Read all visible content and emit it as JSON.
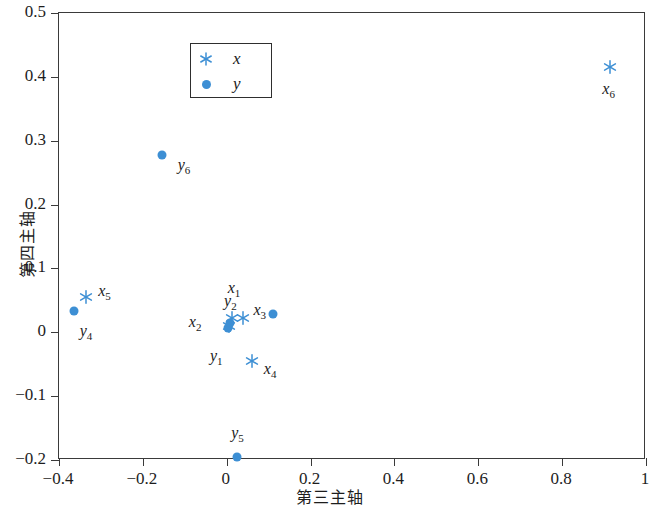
{
  "chart_data": {
    "type": "scatter",
    "title": "",
    "xlabel": "第三主轴",
    "ylabel": "第四主轴",
    "xlim": [
      -0.4,
      1.0
    ],
    "ylim": [
      -0.2,
      0.5
    ],
    "xticks": [
      -0.4,
      -0.2,
      0,
      0.2,
      0.4,
      0.6,
      0.8,
      1
    ],
    "xticklabels": [
      "-0.4",
      "-0.2",
      "0",
      "0.2",
      "0.4",
      "0.6",
      "0.8",
      "1"
    ],
    "yticks": [
      -0.2,
      -0.1,
      0,
      0.1,
      0.2,
      0.3,
      0.4,
      0.5
    ],
    "yticklabels": [
      "-0.2",
      "-0.1",
      "0",
      "0.1",
      "0.2",
      "0.3",
      "0.4",
      "0.5"
    ],
    "grid": false,
    "legend_position": "upper-left-inside",
    "legend": [
      {
        "name": "x",
        "marker": "asterisk",
        "color": "#3d8fd4"
      },
      {
        "name": "y",
        "marker": "circle",
        "color": "#3d8fd4"
      }
    ],
    "series": [
      {
        "name": "x",
        "marker": "asterisk",
        "color": "#3d8fd4",
        "points": [
          {
            "label": "x1",
            "label_text": "x",
            "sub": "1",
            "x": 0.012,
            "y": 0.022,
            "label_dx": -4,
            "label_dy": -30
          },
          {
            "label": "x2",
            "label_text": "x",
            "sub": "2",
            "x": 0.005,
            "y": 0.01,
            "label_dx": -40,
            "label_dy": -4
          },
          {
            "label": "x3",
            "label_text": "x",
            "sub": "3",
            "x": 0.04,
            "y": 0.022,
            "label_dx": 10,
            "label_dy": -8
          },
          {
            "label": "x4",
            "label_text": "x",
            "sub": "4",
            "x": 0.06,
            "y": -0.045,
            "label_dx": 12,
            "label_dy": 8
          },
          {
            "label": "x5",
            "label_text": "x",
            "sub": "5",
            "x": -0.335,
            "y": 0.055,
            "label_dx": 12,
            "label_dy": -6
          },
          {
            "label": "x6",
            "label_text": "x",
            "sub": "6",
            "x": 0.915,
            "y": 0.415,
            "label_dx": -8,
            "label_dy": 22
          }
        ]
      },
      {
        "name": "y",
        "marker": "circle",
        "color": "#3d8fd4",
        "points": [
          {
            "label": "y1",
            "label_text": "y",
            "sub": "1",
            "x": 0.003,
            "y": 0.006,
            "label_dx": -18,
            "label_dy": 28
          },
          {
            "label": "y2",
            "label_text": "y",
            "sub": "2",
            "x": 0.008,
            "y": 0.014,
            "label_dx": -6,
            "label_dy": -22
          },
          {
            "label": "y3",
            "label_text": "y",
            "sub": "3",
            "x": 0.11,
            "y": 0.028,
            "label_dx": 0,
            "label_dy": 0
          },
          {
            "label": "y4",
            "label_text": "y",
            "sub": "4",
            "x": -0.365,
            "y": 0.033,
            "label_dx": 6,
            "label_dy": 20
          },
          {
            "label": "y5",
            "label_text": "y",
            "sub": "5",
            "x": 0.025,
            "y": -0.195,
            "label_dx": -6,
            "label_dy": -24
          },
          {
            "label": "y6",
            "label_text": "y",
            "sub": "6",
            "x": -0.155,
            "y": 0.278,
            "label_dx": 16,
            "label_dy": 10
          }
        ]
      }
    ]
  },
  "axes": {
    "xlabel": "第三主轴",
    "ylabel": "第四主轴"
  },
  "legend": {
    "x_label": "x",
    "y_label": "y"
  },
  "colors": {
    "marker": "#3d8fd4",
    "frame": "#3a3a3a",
    "text": "#1d1d1d"
  }
}
